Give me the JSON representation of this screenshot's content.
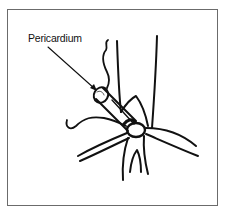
{
  "figure": {
    "labels": [
      {
        "text": "Pericardium",
        "target": "pericardium-sac"
      }
    ]
  },
  "colors": {
    "stroke": "#111111",
    "frame": "#6b6b6b",
    "background": "#ffffff"
  }
}
